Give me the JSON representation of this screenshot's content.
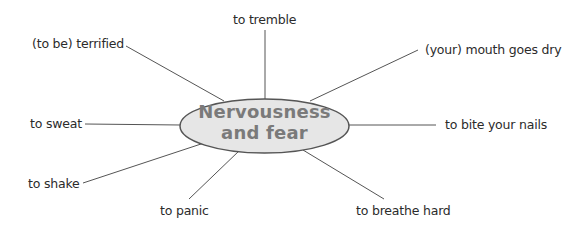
{
  "diagram": {
    "type": "mind-map",
    "center": {
      "line1": "Nervousness",
      "line2": "and fear",
      "fill": "#e6e6e6",
      "stroke": "#555555",
      "text_color": "#7a7a7a"
    },
    "line_color": "#555555",
    "branches": [
      {
        "label": "to tremble"
      },
      {
        "label": "(to be) terrified"
      },
      {
        "label": "(your) mouth goes dry"
      },
      {
        "label": "to sweat"
      },
      {
        "label": "to bite your nails"
      },
      {
        "label": "to shake"
      },
      {
        "label": "to panic"
      },
      {
        "label": "to breathe hard"
      }
    ]
  }
}
